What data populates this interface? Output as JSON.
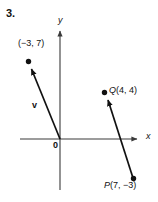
{
  "figure": {
    "problem_number": "3.",
    "axes": {
      "x_label": "x",
      "y_label": "y",
      "origin_label": "0",
      "axis_color": "#3a3a3a"
    },
    "vector_v": {
      "name": "v",
      "tail_label": "",
      "head_label": "(−3, 7)",
      "tail": [
        0,
        0
      ],
      "head": [
        -3,
        7
      ]
    },
    "vector_pq": {
      "name": "",
      "tail_label": "P(7, −3)",
      "head_label": "Q(4, 4)",
      "tail": [
        7,
        -3
      ],
      "head": [
        4,
        4
      ]
    },
    "stroke_color": "#111111"
  },
  "chart_data": {
    "type": "scatter",
    "title": "",
    "xlabel": "x",
    "ylabel": "y",
    "grid": false,
    "legend": null,
    "xlim": [
      -5,
      9
    ],
    "ylim": [
      -5,
      9
    ],
    "annotations": [
      {
        "label": "3.",
        "kind": "problem-number"
      },
      {
        "label": "(−3, 7)",
        "point": [
          -3,
          7
        ],
        "kind": "vector-head"
      },
      {
        "label": "v",
        "kind": "vector-name"
      },
      {
        "label": "Q(4, 4)",
        "point": [
          4,
          4
        ],
        "kind": "vector-head"
      },
      {
        "label": "P(7, −3)",
        "point": [
          7,
          -3
        ],
        "kind": "vector-tail"
      },
      {
        "label": "0",
        "point": [
          0,
          0
        ],
        "kind": "origin"
      }
    ],
    "series": [
      {
        "name": "v",
        "type": "vector",
        "from": [
          0,
          0
        ],
        "to": [
          -3,
          7
        ]
      },
      {
        "name": "PQ",
        "type": "vector",
        "from": [
          7,
          -3
        ],
        "to": [
          4,
          4
        ]
      }
    ]
  }
}
